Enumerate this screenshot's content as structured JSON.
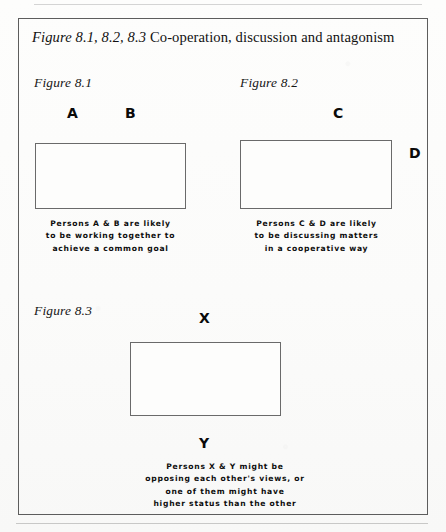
{
  "figure": {
    "title_italic": "Figure 8.1, 8.2, 8.3",
    "title_roman": " Co-operation, discussion and antagonism",
    "title_full": "Figure 8.1, 8.2, 8.3 Co-operation, discussion and antagonism"
  },
  "panels": [
    {
      "label": "Figure 8.1",
      "persons": [
        {
          "name": "A",
          "position": "above-left"
        },
        {
          "name": "B",
          "position": "above-right"
        }
      ],
      "caption": "Persons A & B are likely\nto be working together to\nachieve a common goal"
    },
    {
      "label": "Figure 8.2",
      "persons": [
        {
          "name": "C",
          "position": "above-right"
        },
        {
          "name": "D",
          "position": "right-side"
        }
      ],
      "caption": "Persons C & D are likely\nto be discussing matters\nin a cooperative way"
    },
    {
      "label": "Figure 8.3",
      "persons": [
        {
          "name": "X",
          "position": "above-center"
        },
        {
          "name": "Y",
          "position": "below-center"
        }
      ],
      "caption": "Persons X & Y might be\nopposing each other's views, or\none of them might have\nhigher status than the other"
    }
  ],
  "colors": {
    "paper": "#fefefd",
    "frame_border": "#5d5d5d",
    "box_border": "#6a6a6a",
    "text": "#111111"
  }
}
